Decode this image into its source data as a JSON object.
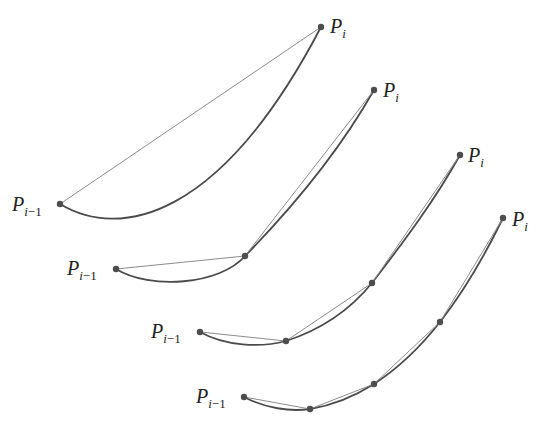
{
  "figure": {
    "colors": {
      "curve": "#4a4a4a",
      "chord": "#8c8c8c",
      "point": "#4d4d4d",
      "text": "#222222"
    },
    "panels": [
      {
        "n_segments": 1,
        "start_label": {
          "main": "P",
          "sub_i": "i",
          "sub_rest": "−1"
        },
        "end_label": {
          "main": "P",
          "sub_i": "i"
        }
      },
      {
        "n_segments": 2,
        "start_label": {
          "main": "P",
          "sub_i": "i",
          "sub_rest": "−1"
        },
        "end_label": {
          "main": "P",
          "sub_i": "i"
        }
      },
      {
        "n_segments": 3,
        "start_label": {
          "main": "P",
          "sub_i": "i",
          "sub_rest": "−1"
        },
        "end_label": {
          "main": "P",
          "sub_i": "i"
        }
      },
      {
        "n_segments": 4,
        "start_label": {
          "main": "P",
          "sub_i": "i",
          "sub_rest": "−1"
        },
        "end_label": {
          "main": "P",
          "sub_i": "i"
        }
      }
    ]
  }
}
